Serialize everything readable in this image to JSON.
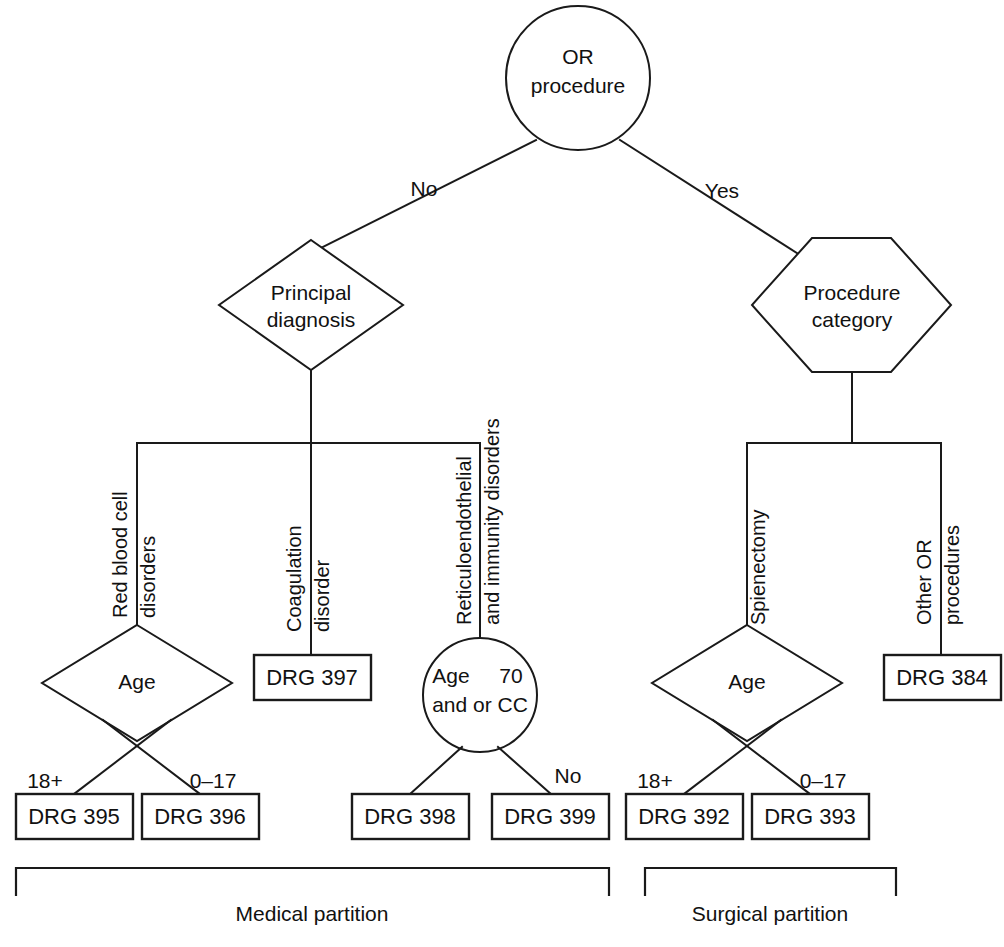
{
  "diagram": {
    "colors": {
      "stroke": "#1a1a1a",
      "background": "#ffffff",
      "text": "#111111"
    },
    "root": {
      "label_line1": "OR",
      "label_line2": "procedure"
    },
    "root_branches": {
      "left_label": "No",
      "right_label": "Yes"
    },
    "medical": {
      "node": {
        "label_line1": "Principal",
        "label_line2": "diagnosis"
      },
      "categories": [
        {
          "line1": "Red blood cell",
          "line2": "disorders"
        },
        {
          "line1": "Coagulation",
          "line2": "disorder"
        },
        {
          "line1": "Reticuloendothelial",
          "line2": "and immunity disorders"
        }
      ],
      "age_node": {
        "label": "Age"
      },
      "age_branches": {
        "left_label": "18+",
        "right_label": "0–17"
      },
      "cc_node": {
        "label_line1_a": "Age",
        "label_line1_b": "70",
        "label_line2": "and or CC"
      },
      "cc_branches": {
        "right_label": "No"
      },
      "boxes": {
        "coagulation": "DRG 397",
        "age_left": "DRG 395",
        "age_right": "DRG 396",
        "cc_left": "DRG 398",
        "cc_right": "DRG 399"
      }
    },
    "surgical": {
      "node": {
        "label_line1": "Procedure",
        "label_line2": "category"
      },
      "categories": [
        {
          "line1": "Spienectomy",
          "line2": ""
        },
        {
          "line1": "Other OR",
          "line2": "procedures"
        }
      ],
      "age_node": {
        "label": "Age"
      },
      "age_branches": {
        "left_label": "18+",
        "right_label": "0–17"
      },
      "boxes": {
        "age_left": "DRG 392",
        "age_right": "DRG 393",
        "other": "DRG 384"
      }
    },
    "partitions": [
      {
        "label": "Medical partition"
      },
      {
        "label": "Surgical partition"
      }
    ]
  }
}
